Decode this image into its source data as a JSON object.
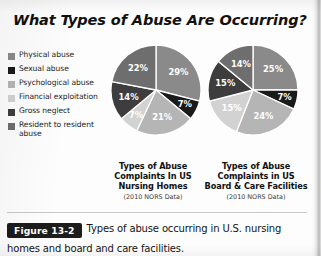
{
  "figure": {
    "heading": "What Types of Abuse Are Occurring?",
    "badge": "Figure 13-2",
    "caption": "Types of abuse occurring in U.S. nursing homes and board and care facilities."
  },
  "legend": {
    "items": [
      {
        "label": "Physical abuse",
        "color": "#8a8a8a",
        "swatch_name": "legend-swatch-physical-abuse"
      },
      {
        "label": "Sexual abuse",
        "color": "#1a1a1a",
        "swatch_name": "legend-swatch-sexual-abuse"
      },
      {
        "label": "Psychological abuse",
        "color": "#b5b5b5",
        "swatch_name": "legend-swatch-psychological-abuse"
      },
      {
        "label": "Financial exploitation",
        "color": "#d2d2d2",
        "swatch_name": "legend-swatch-financial-exploitation"
      },
      {
        "label": "Gross neglect",
        "color": "#3d3d3d",
        "swatch_name": "legend-swatch-gross-neglect"
      },
      {
        "label": "Resident to resident abuse",
        "color": "#6e6e6e",
        "swatch_name": "legend-swatch-resident-to-resident-abuse"
      }
    ]
  },
  "charts": {
    "nursing": {
      "title_line1": "Types of Abuse",
      "title_line2": "Complaints In US",
      "title_line3": "Nursing Homes",
      "source": "(2010 NORS Data)",
      "labels": [
        "29%",
        "7%",
        "21%",
        "7%",
        "14%",
        "22%"
      ]
    },
    "board": {
      "title_line1": "Types of Abuse",
      "title_line2": "Complaints in US",
      "title_line3": "Board & Care Facilities",
      "source": "(2010 NORS Data)",
      "labels": [
        "25%",
        "7%",
        "24%",
        "15%",
        "15%",
        "14%"
      ]
    }
  },
  "chart_data": [
    {
      "type": "pie",
      "title": "Types of Abuse Complaints In US Nursing Homes",
      "subtitle": "(2010 NORS Data)",
      "categories": [
        "Physical abuse",
        "Sexual abuse",
        "Psychological abuse",
        "Financial exploitation",
        "Gross neglect",
        "Resident to resident abuse"
      ],
      "values": [
        29,
        7,
        21,
        7,
        14,
        22
      ],
      "value_labels": [
        "29%",
        "7%",
        "21%",
        "7%",
        "14%",
        "22%"
      ],
      "colors": [
        "#8a8a8a",
        "#1a1a1a",
        "#b5b5b5",
        "#d2d2d2",
        "#3d3d3d",
        "#6e6e6e"
      ],
      "unit": "percent",
      "start_angle_deg": 0,
      "direction": "clockwise",
      "legend_position": "left",
      "grid": false
    },
    {
      "type": "pie",
      "title": "Types of Abuse Complaints in US Board & Care Facilities",
      "subtitle": "(2010 NORS Data)",
      "categories": [
        "Physical abuse",
        "Sexual abuse",
        "Psychological abuse",
        "Financial exploitation",
        "Gross neglect",
        "Resident to resident abuse"
      ],
      "values": [
        25,
        7,
        24,
        15,
        15,
        14
      ],
      "value_labels": [
        "25%",
        "7%",
        "24%",
        "15%",
        "15%",
        "14%"
      ],
      "colors": [
        "#8a8a8a",
        "#1a1a1a",
        "#b5b5b5",
        "#d2d2d2",
        "#3d3d3d",
        "#6e6e6e"
      ],
      "unit": "percent",
      "start_angle_deg": 0,
      "direction": "clockwise",
      "legend_position": "left",
      "grid": false
    }
  ]
}
